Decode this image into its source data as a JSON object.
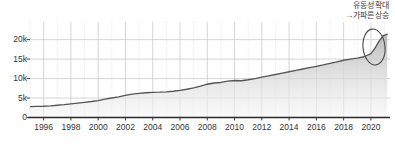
{
  "chart_data": {
    "type": "area",
    "title": "",
    "subtitle": "",
    "xlabel": "",
    "ylabel": "",
    "xlim": [
      1995.0,
      2021.4
    ],
    "ylim": [
      0,
      23500
    ],
    "grid": true,
    "grid_major_style": "solid",
    "grid_minor_style": "dotted",
    "legend": "none",
    "y_ticks": [
      0,
      5000,
      10000,
      15000,
      20000
    ],
    "y_tick_labels": [
      "0",
      "5k",
      "10k",
      "15k",
      "20k"
    ],
    "x_ticks": [
      1996,
      1998,
      2000,
      2002,
      2004,
      2006,
      2008,
      2010,
      2012,
      2014,
      2016,
      2018,
      2020
    ],
    "x_tick_labels": [
      "1996",
      "1998",
      "2000",
      "2002",
      "2004",
      "2006",
      "2008",
      "2010",
      "2012",
      "2014",
      "2016",
      "2018",
      "2020"
    ],
    "x": [
      1995.0,
      1995.5,
      1996.0,
      1996.5,
      1997.0,
      1997.5,
      1998.0,
      1998.5,
      1999.0,
      1999.5,
      2000.0,
      2000.5,
      2001.0,
      2001.5,
      2002.0,
      2002.5,
      2003.0,
      2003.5,
      2004.0,
      2004.5,
      2005.0,
      2005.5,
      2006.0,
      2006.5,
      2007.0,
      2007.5,
      2008.0,
      2008.5,
      2009.0,
      2009.5,
      2010.0,
      2010.5,
      2011.0,
      2011.5,
      2012.0,
      2012.5,
      2013.0,
      2013.5,
      2014.0,
      2014.5,
      2015.0,
      2015.5,
      2016.0,
      2016.5,
      2017.0,
      2017.5,
      2018.0,
      2018.5,
      2019.0,
      2019.5,
      2020.0,
      2020.3,
      2020.6,
      2020.9,
      2021.2
    ],
    "values": [
      2800,
      2850,
      2900,
      3000,
      3150,
      3300,
      3500,
      3700,
      3900,
      4100,
      4350,
      4700,
      5000,
      5300,
      5700,
      6000,
      6200,
      6350,
      6450,
      6500,
      6600,
      6750,
      6950,
      7250,
      7600,
      8050,
      8550,
      8850,
      9000,
      9350,
      9500,
      9450,
      9700,
      10000,
      10350,
      10700,
      11050,
      11400,
      11750,
      12100,
      12450,
      12800,
      13150,
      13500,
      13900,
      14300,
      14700,
      15000,
      15250,
      15600,
      16400,
      17800,
      19600,
      21000,
      21400
    ],
    "series": [
      {
        "name": "series-1",
        "line_color": "#555555",
        "fill_top_color": "#bdbdbd",
        "fill_bottom_color": "#f2f2f2"
      }
    ],
    "annotations": [
      {
        "name": "liquidity-expansion-note",
        "lines": [
          "유동성 확대",
          "→가파른 상승"
        ],
        "position": "top-right",
        "color": "#3a3a3a"
      },
      {
        "name": "highlight-ellipse",
        "shape": "ellipse",
        "target": "final-spike",
        "color": "#4a4a4a"
      }
    ]
  },
  "annotation": {
    "line1": "유동성 확대",
    "line2": "→가파른 상승"
  },
  "colors": {
    "axis": "#2b2b2b",
    "line": "#555555",
    "grid_major": "#d0d0d0",
    "grid_minor": "#d8d8d8",
    "fill_top": "#bdbdbd",
    "fill_bottom": "#f4f4f4",
    "text": "#333333",
    "ellipse": "#4a4a4a",
    "background": "#ffffff"
  }
}
